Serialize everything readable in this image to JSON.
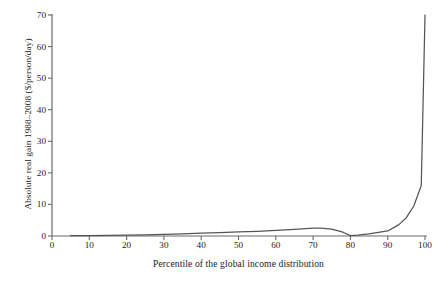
{
  "chart_data": {
    "type": "line",
    "title": "",
    "xlabel": "Percentile of the global income distribution",
    "ylabel": "Absolute real gain 1988–2008 ($/person/day)",
    "xlim": [
      0,
      100
    ],
    "ylim": [
      0,
      70
    ],
    "grid": false,
    "legend": "none",
    "line_color": "#555555",
    "axis_color": "#6b6b6b",
    "text_color": "#232323",
    "background_color": "#ffffff",
    "xticks": [
      "0",
      "10",
      "20",
      "30",
      "40",
      "50",
      "60",
      "70",
      "80",
      "90",
      "100"
    ],
    "yticks": [
      "0",
      "10",
      "20",
      "30",
      "40",
      "50",
      "60",
      "70"
    ],
    "series": [
      {
        "name": "Absolute real gain 1988–2008",
        "x": [
          5,
          10,
          15,
          20,
          25,
          30,
          35,
          40,
          45,
          50,
          55,
          60,
          65,
          70,
          72,
          75,
          78,
          80,
          82,
          85,
          90,
          93,
          95,
          97,
          99,
          100
        ],
        "values": [
          0.1,
          0.15,
          0.2,
          0.25,
          0.35,
          0.5,
          0.7,
          0.9,
          1.1,
          1.3,
          1.5,
          1.8,
          2.1,
          2.5,
          2.5,
          2.2,
          1.2,
          0.1,
          0.3,
          0.7,
          1.6,
          3.6,
          5.8,
          9.5,
          16.0,
          70.0
        ]
      }
    ]
  }
}
